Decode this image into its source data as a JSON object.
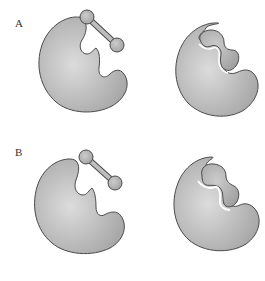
{
  "panels": [
    {
      "label": "A",
      "description": "Lock-and-key: substrate separate from enzyme; enzyme active site matches substrate shape; substrate bound in pre-shaped active site"
    },
    {
      "label": "B",
      "description": "Induced fit: substrate separate from enzyme; enzyme active site changes shape on binding; substrate bound"
    }
  ],
  "colors": {
    "enzyme_fill_center": "#d9d9d9",
    "enzyme_fill_edge": "#a8a8a8",
    "outline": "#4a4a4a",
    "substrate_fill": "#b8b8b8",
    "background": "#ffffff"
  }
}
